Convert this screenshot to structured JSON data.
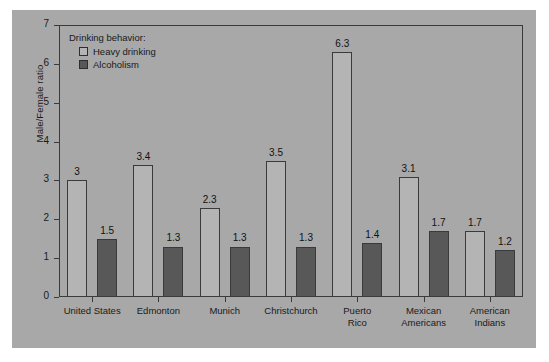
{
  "chart_data": {
    "type": "bar",
    "title": "",
    "xlabel": "",
    "ylabel": "Male/Female ratio",
    "ylim": [
      0,
      7
    ],
    "yticks": [
      "0",
      "1",
      "2",
      "3",
      "4",
      "5",
      "6",
      "7"
    ],
    "grid": false,
    "legend_position": "top-left",
    "legend_title": "Drinking behavior:",
    "categories": [
      "United States",
      "Edmonton",
      "Munich",
      "Christchurch",
      "Puerto\nRico",
      "Mexican\nAmericans",
      "American\nIndians"
    ],
    "series": [
      {
        "name": "Heavy drinking",
        "color": "#b4b4b4",
        "values": [
          3,
          3.4,
          2.3,
          3.5,
          6.3,
          3.1,
          1.7
        ],
        "labels": [
          "3",
          "3.4",
          "2.3",
          "3.5",
          "6.3",
          "3.1",
          "1.7"
        ]
      },
      {
        "name": "Alcoholism",
        "color": "#585858",
        "values": [
          1.5,
          1.3,
          1.3,
          1.3,
          1.4,
          1.7,
          1.2
        ],
        "labels": [
          "1.5",
          "1.3",
          "1.3",
          "1.3",
          "1.4",
          "1.7",
          "1.2"
        ]
      }
    ]
  },
  "colors": {
    "panel_background": "#a8a8a8",
    "page_background": "#ffffff",
    "axis": "#3a3a3a",
    "text": "#1a1a1a",
    "heavy_drinking": "#b4b4b4",
    "alcoholism": "#585858"
  }
}
